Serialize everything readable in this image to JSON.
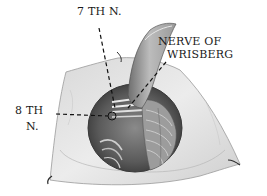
{
  "figure": {
    "labels": {
      "seventh_nerve": "7 TH N.",
      "nerve_of_wrisberg_line1": "NERVE OF",
      "nerve_of_wrisberg_line2": "WRISBERG",
      "eighth_nerve_line1": "8 TH",
      "eighth_nerve_line2": "N."
    },
    "colors": {
      "ink": "#1a1a1a",
      "membrane_light": "#e6e6e6",
      "membrane_mid": "#bdbdbd",
      "cavity_dark": "#4a4a4a",
      "background": "#ffffff"
    }
  }
}
